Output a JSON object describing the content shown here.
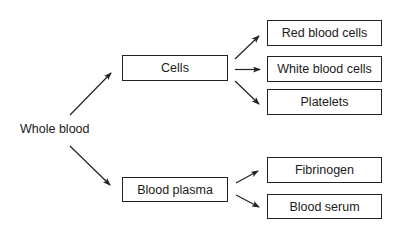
{
  "diagram": {
    "root": {
      "label": "Whole blood"
    },
    "level1": [
      {
        "id": "cells",
        "label": "Cells"
      },
      {
        "id": "plasma",
        "label": "Blood plasma"
      }
    ],
    "cells_children": [
      {
        "label": "Red blood cells"
      },
      {
        "label": "White blood cells"
      },
      {
        "label": "Platelets"
      }
    ],
    "plasma_children": [
      {
        "label": "Fibrinogen"
      },
      {
        "label": "Blood serum"
      }
    ],
    "edges": [
      [
        "Whole blood",
        "Cells"
      ],
      [
        "Whole blood",
        "Blood plasma"
      ],
      [
        "Cells",
        "Red blood cells"
      ],
      [
        "Cells",
        "White blood cells"
      ],
      [
        "Cells",
        "Platelets"
      ],
      [
        "Blood plasma",
        "Fibrinogen"
      ],
      [
        "Blood plasma",
        "Blood serum"
      ]
    ],
    "colors": {
      "line": "#222222",
      "background": "#ffffff"
    }
  }
}
